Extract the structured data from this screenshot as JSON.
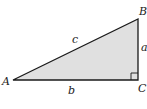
{
  "diagram": {
    "type": "right-triangle",
    "vertices": {
      "A": {
        "label": "A"
      },
      "B": {
        "label": "B"
      },
      "C": {
        "label": "C"
      }
    },
    "sides": {
      "a": {
        "label": "a",
        "between": [
          "B",
          "C"
        ]
      },
      "b": {
        "label": "b",
        "between": [
          "A",
          "C"
        ]
      },
      "c": {
        "label": "c",
        "between": [
          "A",
          "B"
        ],
        "role": "hypotenuse"
      }
    },
    "right_angle_at": "C",
    "colors": {
      "fill": "#e0e0e0",
      "stroke": "#1a1a1a"
    }
  }
}
